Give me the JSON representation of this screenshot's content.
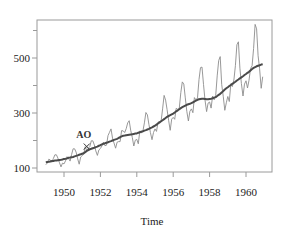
{
  "chart_data": {
    "type": "line",
    "title": "",
    "xlabel": "Time",
    "ylabel": "",
    "xlim": [
      1948.5,
      1961.3
    ],
    "ylim": [
      80,
      640
    ],
    "grid": false,
    "legend": null,
    "x_ticks": [
      1950,
      1952,
      1954,
      1956,
      1958,
      1960
    ],
    "x_tick_labels": [
      "1950",
      "1952",
      "1954",
      "1956",
      "1958",
      "1960"
    ],
    "y_ticks_major": [
      100,
      300,
      500
    ],
    "y_tick_labels": [
      "100",
      "300",
      "500"
    ],
    "y_ticks_minor": [
      200,
      400,
      600
    ],
    "x_start": 1949.0,
    "frequency": 12,
    "annotations": [
      {
        "text": "AO",
        "x": 1951.25,
        "y": 178
      }
    ],
    "series": [
      {
        "name": "observed",
        "style": "thin",
        "color": "#8c8c8c",
        "values": [
          112,
          118,
          132,
          129,
          121,
          135,
          148,
          148,
          136,
          119,
          104,
          118,
          115,
          126,
          141,
          135,
          125,
          149,
          170,
          170,
          158,
          133,
          114,
          140,
          145,
          150,
          178,
          163,
          172,
          178,
          199,
          199,
          184,
          162,
          146,
          166,
          171,
          180,
          193,
          181,
          183,
          218,
          230,
          242,
          209,
          191,
          172,
          194,
          196,
          196,
          236,
          235,
          229,
          243,
          264,
          272,
          237,
          211,
          180,
          201,
          204,
          188,
          235,
          227,
          234,
          264,
          302,
          293,
          259,
          229,
          203,
          229,
          242,
          233,
          267,
          269,
          270,
          315,
          364,
          347,
          312,
          274,
          237,
          278,
          284,
          277,
          317,
          313,
          318,
          374,
          413,
          405,
          355,
          306,
          271,
          306,
          315,
          301,
          356,
          348,
          355,
          422,
          465,
          467,
          404,
          347,
          305,
          336,
          340,
          318,
          362,
          348,
          363,
          435,
          491,
          505,
          404,
          359,
          310,
          337,
          360,
          342,
          406,
          396,
          420,
          472,
          548,
          559,
          463,
          407,
          362,
          405,
          417,
          391,
          419,
          461,
          472,
          535,
          622,
          606,
          508,
          461,
          390,
          432
        ]
      },
      {
        "name": "trend",
        "style": "thick",
        "color": "#4a4a4a",
        "values": [
          121,
          122,
          123,
          124,
          125,
          126,
          127,
          127,
          128,
          129,
          130,
          131,
          133,
          134,
          135,
          137,
          138,
          139,
          140,
          142,
          144,
          146,
          148,
          150,
          152,
          154,
          158,
          162,
          165,
          168,
          170,
          172,
          174,
          176,
          178,
          181,
          183,
          186,
          188,
          190,
          192,
          194,
          196,
          198,
          200,
          202,
          204,
          206,
          209,
          212,
          215,
          217,
          218,
          219,
          220,
          221,
          222,
          223,
          224,
          225,
          226,
          228,
          230,
          232,
          234,
          236,
          238,
          240,
          242,
          245,
          248,
          251,
          254,
          258,
          262,
          266,
          270,
          274,
          278,
          282,
          286,
          289,
          292,
          295,
          298,
          302,
          306,
          310,
          314,
          318,
          321,
          324,
          327,
          330,
          332,
          334,
          336,
          339,
          342,
          345,
          348,
          350,
          351,
          352,
          352,
          351,
          350,
          350,
          351,
          352,
          354,
          356,
          358,
          362,
          366,
          370,
          375,
          380,
          385,
          390,
          394,
          398,
          402,
          406,
          410,
          414,
          418,
          422,
          426,
          430,
          434,
          438,
          442,
          446,
          450,
          455,
          460,
          464,
          467,
          470,
          472,
          474,
          476,
          477
        ]
      }
    ]
  },
  "plot": {
    "frame": {
      "left": 37,
      "top": 20,
      "right": 272,
      "bottom": 172
    },
    "x_ref": {
      "year": 1950,
      "px": 64,
      "px_per_year": 18.2
    },
    "y_ref": {
      "value": 500,
      "px": 58,
      "px_per_unit": 0.275
    }
  }
}
